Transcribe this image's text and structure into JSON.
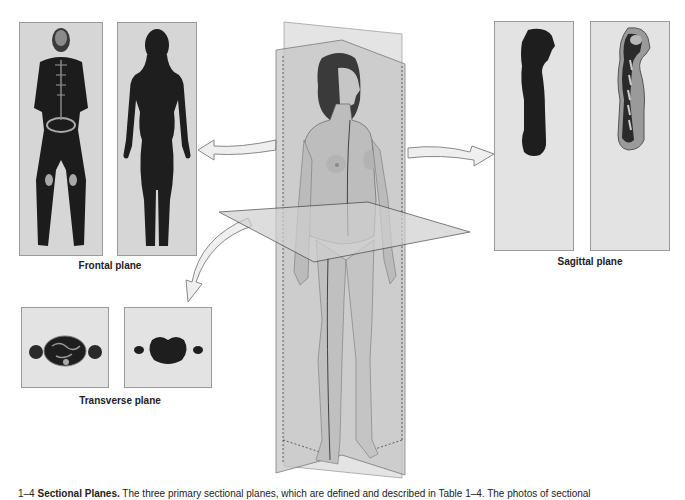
{
  "figure": {
    "title": "Sectional Planes",
    "caption_prefix": "1–4",
    "caption_bold": "Sectional Planes.",
    "caption_text": "The three primary sectional planes, which are defined and described in Table 1–4. The photos of sectional"
  },
  "panels": {
    "frontal": {
      "label": "Frontal plane",
      "images": [
        "frontal-mri-scan",
        "frontal-silhouette"
      ]
    },
    "sagittal": {
      "label": "Sagittal plane",
      "images": [
        "sagittal-silhouette",
        "sagittal-mri-scan"
      ]
    },
    "transverse": {
      "label": "Transverse plane",
      "images": [
        "transverse-ct-scan",
        "transverse-silhouette"
      ]
    }
  },
  "center": {
    "description": "Standing female figure intersected by frontal, sagittal and transverse planes"
  },
  "colors": {
    "panel_bg": "#d6d6d6",
    "panel_light": "#e3e3e3",
    "plane_fill": "#c8c8c8",
    "skin": "#bdbdbd",
    "dark": "#1e1e1e"
  }
}
